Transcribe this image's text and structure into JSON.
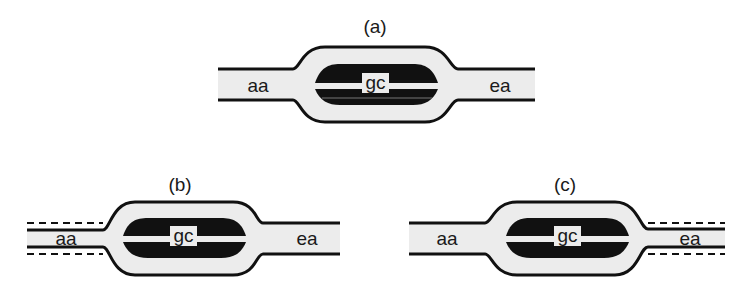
{
  "panels": [
    {
      "id": "a",
      "label": "(a)",
      "left_label": "aa",
      "center_label": "gc",
      "right_label": "ea",
      "dashed_side": "none"
    },
    {
      "id": "b",
      "label": "(b)",
      "left_label": "aa",
      "center_label": "gc",
      "right_label": "ea",
      "dashed_side": "left"
    },
    {
      "id": "c",
      "label": "(c)",
      "left_label": "aa",
      "center_label": "gc",
      "right_label": "ea",
      "dashed_side": "right"
    }
  ],
  "colors": {
    "outline": "#111111",
    "fill_light": "#ececec",
    "fill_dark": "#111111",
    "background": "#ffffff"
  }
}
